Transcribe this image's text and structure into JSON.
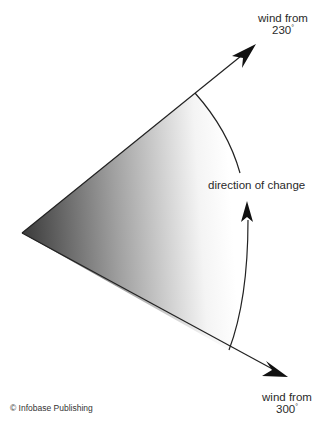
{
  "diagram": {
    "labels": {
      "wind_230_line1": "wind from",
      "wind_230_line2": "230",
      "wind_300_line1": "wind from",
      "wind_300_line2": "300",
      "degree_symbol": "°",
      "direction": "direction of change"
    },
    "credit": "© Infobase Publishing",
    "colors": {
      "line": "#222222",
      "gradient_dark": "#3a3a3a",
      "gradient_light": "#ffffff",
      "text": "#2a2a2a"
    }
  }
}
